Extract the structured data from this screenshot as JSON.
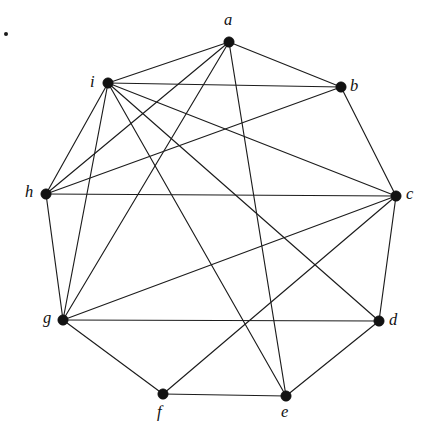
{
  "figure": {
    "kind": "undirected-graph-drawing",
    "background_color": "#ffffff",
    "edge_color": "#1c1c1c",
    "vertex_color": "#121212",
    "label_color": "#111111",
    "width": 429,
    "height": 433
  },
  "stray_mark": {
    "name": "stray-dot",
    "x": 4,
    "y": 32
  },
  "graph_data": {
    "type": "graph",
    "layout": "circular",
    "vertex_count": 9,
    "edge_count": 20,
    "vertices": [
      {
        "id": "a",
        "label": "a",
        "x": 229,
        "y": 42,
        "label_x": 224,
        "label_y": 12,
        "degree": 5
      },
      {
        "id": "b",
        "label": "b",
        "x": 341,
        "y": 87,
        "label_x": 350,
        "label_y": 78,
        "degree": 4
      },
      {
        "id": "c",
        "label": "c",
        "x": 396,
        "y": 196,
        "label_x": 406,
        "label_y": 186,
        "degree": 7
      },
      {
        "id": "d",
        "label": "d",
        "x": 379,
        "y": 321,
        "label_x": 389,
        "label_y": 312,
        "degree": 4
      },
      {
        "id": "e",
        "label": "e",
        "x": 286,
        "y": 396,
        "label_x": 281,
        "label_y": 404,
        "degree": 3
      },
      {
        "id": "f",
        "label": "f",
        "x": 163,
        "y": 394,
        "label_x": 157,
        "label_y": 404,
        "degree": 3
      },
      {
        "id": "g",
        "label": "g",
        "x": 63,
        "y": 320,
        "label_x": 43,
        "label_y": 310,
        "degree": 5
      },
      {
        "id": "h",
        "label": "h",
        "x": 46,
        "y": 194,
        "label_x": 25,
        "label_y": 184,
        "degree": 5
      },
      {
        "id": "i",
        "label": "i",
        "x": 108,
        "y": 83,
        "label_x": 90,
        "label_y": 74,
        "degree": 7
      }
    ],
    "edges": [
      {
        "source": "a",
        "target": "i"
      },
      {
        "source": "a",
        "target": "b"
      },
      {
        "source": "a",
        "target": "h"
      },
      {
        "source": "a",
        "target": "g"
      },
      {
        "source": "a",
        "target": "e"
      },
      {
        "source": "b",
        "target": "i"
      },
      {
        "source": "b",
        "target": "h"
      },
      {
        "source": "b",
        "target": "c"
      },
      {
        "source": "c",
        "target": "i"
      },
      {
        "source": "c",
        "target": "h"
      },
      {
        "source": "c",
        "target": "g"
      },
      {
        "source": "c",
        "target": "f"
      },
      {
        "source": "c",
        "target": "d"
      },
      {
        "source": "d",
        "target": "i"
      },
      {
        "source": "d",
        "target": "g"
      },
      {
        "source": "d",
        "target": "e"
      },
      {
        "source": "e",
        "target": "i"
      },
      {
        "source": "e",
        "target": "f"
      },
      {
        "source": "f",
        "target": "g"
      },
      {
        "source": "g",
        "target": "h"
      },
      {
        "source": "h",
        "target": "i"
      },
      {
        "source": "i",
        "target": "g"
      }
    ]
  }
}
